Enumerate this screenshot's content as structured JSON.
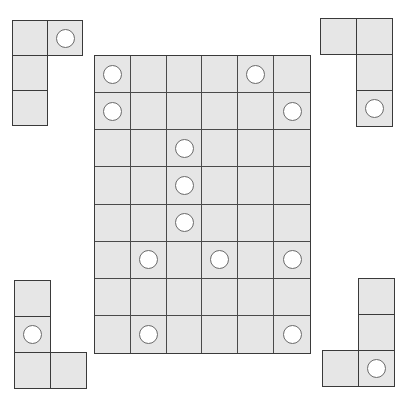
{
  "puzzle": {
    "board": {
      "rows": 8,
      "cols": 6,
      "x": 94,
      "y": 55,
      "width": 217,
      "height": 299,
      "circles": [
        [
          0,
          0
        ],
        [
          0,
          4
        ],
        [
          1,
          0
        ],
        [
          1,
          5
        ],
        [
          2,
          2
        ],
        [
          3,
          2
        ],
        [
          4,
          2
        ],
        [
          5,
          1
        ],
        [
          5,
          3
        ],
        [
          5,
          5
        ],
        [
          7,
          1
        ],
        [
          7,
          5
        ]
      ]
    },
    "pieces": [
      {
        "name": "piece-top-left",
        "x": 12,
        "y": 20,
        "cell": 35,
        "cells": [
          [
            0,
            0,
            false
          ],
          [
            0,
            1,
            true
          ],
          [
            1,
            0,
            false
          ],
          [
            2,
            0,
            false
          ]
        ]
      },
      {
        "name": "piece-top-right",
        "x": 320,
        "y": 18,
        "cell": 36,
        "cells": [
          [
            0,
            0,
            false
          ],
          [
            0,
            1,
            false
          ],
          [
            1,
            1,
            false
          ],
          [
            2,
            1,
            true
          ]
        ]
      },
      {
        "name": "piece-bottom-left",
        "x": 14,
        "y": 280,
        "cell": 36,
        "cells": [
          [
            0,
            0,
            false
          ],
          [
            1,
            0,
            true
          ],
          [
            2,
            0,
            false
          ],
          [
            2,
            1,
            false
          ]
        ]
      },
      {
        "name": "piece-bottom-right",
        "x": 322,
        "y": 278,
        "cell": 36,
        "cells": [
          [
            0,
            1,
            false
          ],
          [
            1,
            1,
            false
          ],
          [
            2,
            0,
            false
          ],
          [
            2,
            1,
            true
          ]
        ]
      }
    ],
    "colors": {
      "cell_fill": "#e6e6e6",
      "border": "#3a3a3a",
      "circle_fill": "#ffffff",
      "circle_outline": "#6a6a6a",
      "background": "#ffffff"
    }
  }
}
